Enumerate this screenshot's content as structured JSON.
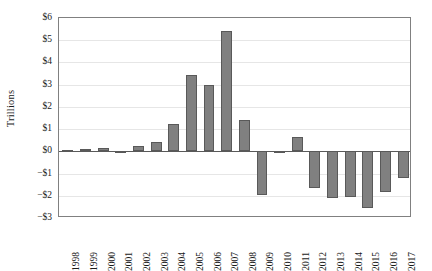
{
  "chart_data": {
    "type": "bar",
    "title": "",
    "subtitle": "",
    "xlabel": "",
    "ylabel": "Trillions",
    "categories": [
      "1998",
      "1999",
      "2000",
      "2001",
      "2002",
      "2003",
      "2004",
      "2005",
      "2006",
      "2007",
      "2008",
      "2009",
      "2010",
      "2011",
      "2012",
      "2013",
      "2014",
      "2015",
      "2016",
      "2017"
    ],
    "values": [
      0.05,
      0.12,
      0.15,
      -0.08,
      0.22,
      0.4,
      1.25,
      3.45,
      3.0,
      5.4,
      1.4,
      -1.95,
      -0.05,
      0.65,
      -1.65,
      -2.1,
      -2.05,
      -2.55,
      -1.85,
      -1.2
    ],
    "series": [
      {
        "name": "Trillions",
        "values": [
          0.05,
          0.12,
          0.15,
          -0.08,
          0.22,
          0.4,
          1.25,
          3.45,
          3.0,
          5.4,
          1.4,
          -1.95,
          -0.05,
          0.65,
          -1.65,
          -2.1,
          -2.05,
          -2.55,
          -1.85,
          -1.2
        ]
      }
    ],
    "ylim": [
      -3,
      6
    ],
    "yticks": [
      6,
      5,
      4,
      3,
      2,
      1,
      0,
      -1,
      -2,
      -3
    ],
    "ytick_labels": [
      "$6",
      "$5",
      "$4",
      "$3",
      "$2",
      "$1",
      "$0",
      "−$1",
      "−$2",
      "−$3"
    ],
    "grid": true,
    "grid_axis": "y",
    "legend": false,
    "legend_position": "none",
    "bar_color": "#808080",
    "bar_border_color": "#595959",
    "gridline_color": "#e6e6e6",
    "axis_color": "#808080",
    "zero_line_color": "#595959",
    "xtick_rotation": -90
  }
}
